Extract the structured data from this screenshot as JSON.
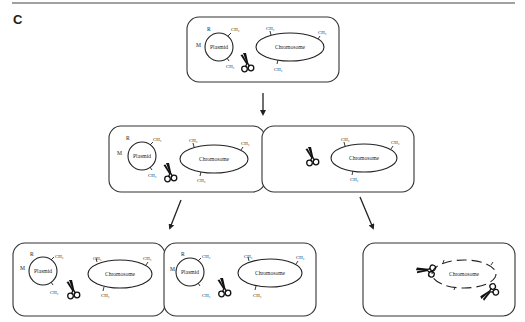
{
  "figure": {
    "panel_label": "C",
    "top_rule": true
  },
  "labels": {
    "plasmid": "Plasmid",
    "chromosome": "Chromosome",
    "methyl": "CH₃",
    "R": "R",
    "M": "M"
  },
  "cells": [
    {
      "id": "parent",
      "row": 0,
      "has_plasmid": true,
      "chromosome_state": "methylated",
      "scissors": 1
    },
    {
      "id": "daughter-with-plasmid",
      "row": 1,
      "has_plasmid": true,
      "chromosome_state": "methylated",
      "scissors": 1
    },
    {
      "id": "daughter-without-plasmid",
      "row": 1,
      "has_plasmid": false,
      "chromosome_state": "methylated",
      "scissors": 1
    },
    {
      "id": "granddaughter-a",
      "row": 2,
      "has_plasmid": true,
      "chromosome_state": "methylated",
      "scissors": 1
    },
    {
      "id": "granddaughter-b",
      "row": 2,
      "has_plasmid": true,
      "chromosome_state": "methylated",
      "scissors": 1
    },
    {
      "id": "granddaughter-plasmid-free",
      "row": 2,
      "has_plasmid": false,
      "chromosome_state": "cleaved",
      "scissors": 2
    }
  ],
  "arrows": [
    {
      "from": "parent",
      "to": "row-1"
    },
    {
      "from": "daughter-with-plasmid",
      "to": "row-2-left"
    },
    {
      "from": "daughter-without-plasmid",
      "to": "row-2-right"
    }
  ]
}
